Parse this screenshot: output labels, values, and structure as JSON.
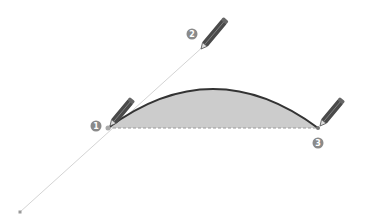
{
  "diagram": {
    "guide_line": {
      "from": [
        20,
        212
      ],
      "to": [
        206,
        44
      ]
    },
    "curve": {
      "start": [
        108,
        128
      ],
      "control": [
        213,
        50
      ],
      "end": [
        318,
        128
      ]
    },
    "steps": [
      {
        "number": "1",
        "position": [
          96,
          126
        ]
      },
      {
        "number": "2",
        "position": [
          192,
          34
        ]
      },
      {
        "number": "3",
        "position": [
          318,
          143
        ]
      }
    ],
    "colors": {
      "fill": "#c8c8c8",
      "curve": "#333333",
      "guide": "#d8d8d8",
      "badge": "#888888",
      "pencil": "#555555"
    }
  }
}
